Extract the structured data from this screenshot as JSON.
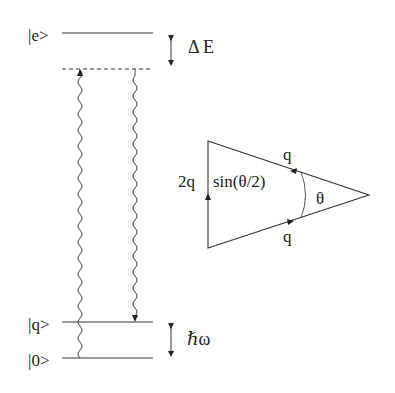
{
  "diagram": {
    "levels": {
      "excited": {
        "label": "|e>"
      },
      "phonon": {
        "label": "|q>"
      },
      "ground": {
        "label": "|0>"
      }
    },
    "detuning_label": "Δ E",
    "phonon_energy_label": "ℏω",
    "triangle": {
      "side_label_vertical": "2q",
      "side_label_vertical_sin": "sin(θ/2)",
      "side_label_top": "q",
      "side_label_bottom": "q",
      "angle_label": "θ"
    },
    "colors": {
      "lines": "#333333",
      "background": "#ffffff"
    }
  }
}
